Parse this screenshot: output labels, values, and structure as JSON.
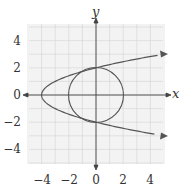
{
  "chart_data": {
    "type": "line",
    "title": "",
    "xlabel": "x",
    "ylabel": "y",
    "xlim": [
      -5,
      5
    ],
    "ylim": [
      -5,
      5
    ],
    "grid": true,
    "x_ticks": [
      "-4",
      "-2",
      "0",
      "2",
      "4"
    ],
    "y_ticks": [
      "4",
      "2",
      "0",
      "-2",
      "-4"
    ],
    "series": [
      {
        "name": "parabola",
        "equation": "x = y^2 - 4",
        "vertex": [
          -4,
          0
        ],
        "points": [
          [
            5,
            3
          ],
          [
            0,
            2
          ],
          [
            -3,
            1
          ],
          [
            -4,
            0
          ],
          [
            -3,
            -1
          ],
          [
            0,
            -2
          ],
          [
            5,
            -3
          ]
        ],
        "arrows": "both ends"
      },
      {
        "name": "circle",
        "equation": "x^2 + y^2 = 4",
        "center": [
          0,
          0
        ],
        "radius": 2
      }
    ],
    "intersections": [
      [
        0,
        2
      ],
      [
        0,
        -2
      ]
    ]
  },
  "labels": {
    "x_axis": "x",
    "y_axis": "y",
    "x_ticks": [
      "−4",
      "−2",
      "0",
      "2",
      "4"
    ],
    "y_ticks": [
      "4",
      "2",
      "0",
      "−2",
      "−4"
    ]
  }
}
